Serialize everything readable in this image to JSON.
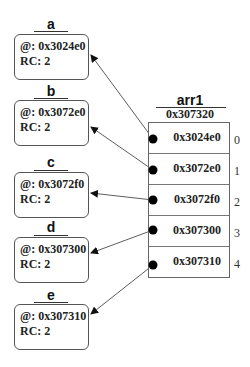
{
  "objects": [
    {
      "name": "a",
      "address_label": "@: 0x3024e0",
      "rc_label": "RC: 2"
    },
    {
      "name": "b",
      "address_label": "@: 0x3072e0",
      "rc_label": "RC: 2"
    },
    {
      "name": "c",
      "address_label": "@: 0x3072f0",
      "rc_label": "RC: 2"
    },
    {
      "name": "d",
      "address_label": "@: 0x307300",
      "rc_label": "RC: 2"
    },
    {
      "name": "e",
      "address_label": "@: 0x307310",
      "rc_label": "RC: 2"
    }
  ],
  "array": {
    "name": "arr1",
    "address": "0x307320",
    "cells": [
      {
        "value": "0x3024e0",
        "index": "0"
      },
      {
        "value": "0x3072e0",
        "index": "1"
      },
      {
        "value": "0x3072f0",
        "index": "2"
      },
      {
        "value": "0x307300",
        "index": "3"
      },
      {
        "value": "0x307310",
        "index": "4"
      }
    ]
  },
  "colors": {
    "line": "#333333",
    "dot": "#000000"
  }
}
